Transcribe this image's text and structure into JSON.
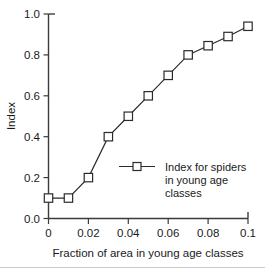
{
  "chart_data": {
    "type": "line",
    "title": "",
    "subtitle": "",
    "xlabel": "Fraction of area in young age classes",
    "ylabel": "Index",
    "xlim": [
      0,
      0.1
    ],
    "ylim": [
      0,
      1.0
    ],
    "grid": false,
    "legend_position": "inside-center-right",
    "x_ticks": [
      0,
      0.02,
      0.04,
      0.06,
      0.08,
      0.1
    ],
    "x_tick_labels": [
      "0",
      "0.02",
      "0.04",
      "0.06",
      "0.08",
      "0.1"
    ],
    "y_ticks": [
      0.0,
      0.2,
      0.4,
      0.6,
      0.8,
      1.0
    ],
    "y_tick_labels": [
      "0.0",
      "0.2",
      "0.4",
      "0.6",
      "0.8",
      "1.0"
    ],
    "marker": "open-square",
    "series": [
      {
        "name": "Index for spiders in young age classes",
        "legend_lines": [
          "Index for spiders",
          "in young age",
          "classes"
        ],
        "x": [
          0,
          0.01,
          0.02,
          0.03,
          0.04,
          0.05,
          0.06,
          0.07,
          0.08,
          0.09,
          0.1
        ],
        "values": [
          0.1,
          0.1,
          0.2,
          0.4,
          0.5,
          0.6,
          0.7,
          0.8,
          0.845,
          0.89,
          0.94
        ]
      }
    ]
  },
  "colors": {
    "line": "#2b2b2b",
    "axis": "#3b3b3b",
    "marker_fill": "#ffffff",
    "text": "#1a1a1a",
    "background": "#ffffff"
  }
}
